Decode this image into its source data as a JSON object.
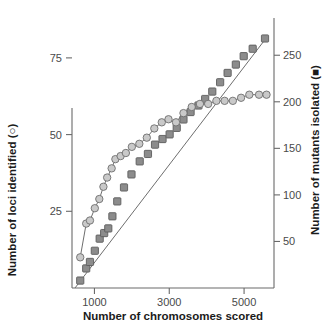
{
  "chart_data": {
    "type": "scatter",
    "title": "",
    "xlabel": "Number of chromosomes scored",
    "ylabel": "Number of loci identified (○)",
    "y2label": "Number of mutants isolated (■)",
    "xlim": [
      400,
      5800
    ],
    "ylim": [
      0,
      88
    ],
    "y2lim": [
      0,
      290
    ],
    "xticks": [
      1000,
      3000,
      5000
    ],
    "xticklabels": [
      "1000",
      "3000",
      "5000"
    ],
    "yticks": [
      25,
      50,
      75
    ],
    "yticklabels": [
      "25",
      "50",
      "75"
    ],
    "y2ticks": [
      50,
      100,
      150,
      200,
      250
    ],
    "y2ticklabels": [
      "50",
      "100",
      "150",
      "200",
      "250"
    ],
    "grid": false,
    "legend": "inline-in-axis-labels",
    "series": [
      {
        "name": "Number of loci identified",
        "marker": "circle",
        "axis": "left",
        "color": "#c9c9c9",
        "edge_color": "#6e6e6e",
        "x": [
          620,
          780,
          880,
          1010,
          1130,
          1240,
          1340,
          1460,
          1560,
          1700,
          1840,
          2000,
          2200,
          2400,
          2600,
          2800,
          2980,
          3180,
          3380,
          3600,
          3820,
          4040,
          4260,
          4480,
          4700,
          4920,
          5140,
          5400,
          5600
        ],
        "y": [
          10,
          21,
          22,
          26,
          29,
          33,
          36,
          39,
          42,
          43,
          44,
          46,
          47,
          49,
          52,
          54,
          55,
          54,
          57,
          59,
          60,
          60,
          61,
          61,
          61,
          62,
          63,
          63,
          63
        ]
      },
      {
        "name": "Number of mutants isolated",
        "marker": "square",
        "axis": "right",
        "color": "#8c8c8c",
        "edge_color": "#5c5c5c",
        "x": [
          620,
          780,
          880,
          1010,
          1140,
          1260,
          1370,
          1480,
          1610,
          1790,
          1990,
          2210,
          2430,
          2620,
          2820,
          3010,
          3200,
          3380,
          3570,
          3780,
          3960,
          4150,
          4360,
          4560,
          4780,
          4990,
          5230,
          5560
        ],
        "y": [
          8,
          21,
          28,
          40,
          53,
          59,
          64,
          77,
          93,
          108,
          122,
          136,
          144,
          154,
          160,
          165,
          172,
          181,
          189,
          196,
          203,
          211,
          221,
          231,
          240,
          249,
          257,
          268
        ]
      }
    ],
    "fit_lines": [
      {
        "for_series": "Number of mutants isolated",
        "axis": "right",
        "x": [
          480,
          5620
        ],
        "y": [
          0,
          270
        ]
      },
      {
        "for_series": "Number of loci identified",
        "axis": "left",
        "smooth": true
      }
    ]
  }
}
